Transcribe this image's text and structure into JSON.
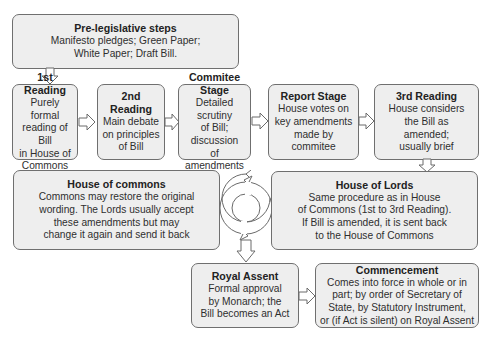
{
  "diagram": {
    "type": "flowchart",
    "colors": {
      "box_fill": "#eeeeee",
      "box_border": "#6f6f6f",
      "text": "#2a2a2a"
    },
    "nodes": [
      {
        "id": "pre",
        "title": "Pre-legislative steps",
        "body": "Manifesto pledges; Green Paper;\nWhite Paper; Draft Bill."
      },
      {
        "id": "r1",
        "title": "1st Reading",
        "body": "Purely formal\nreading of Bill\nin House of\nCommons"
      },
      {
        "id": "r2",
        "title": "2nd Reading",
        "body": "Main debate\non principles\nof Bill"
      },
      {
        "id": "committee",
        "title": "Commitee Stage",
        "body": "Detailed scrutiny\nof Bill; discussion\nof amendments"
      },
      {
        "id": "report",
        "title": "Report Stage",
        "body": "House votes on\nkey amendments\nmade by commitee"
      },
      {
        "id": "r3",
        "title": "3rd Reading",
        "body": "House considers\nthe Bill as\namended;\nusually brief"
      },
      {
        "id": "commons",
        "title": "House of commons",
        "body": "Commons may restore the original\nwording. The Lords usually accept\nthese amendments but may\nchange it again and send it back"
      },
      {
        "id": "lords",
        "title": "House of Lords",
        "body": "Same procedure as in House\nof Commons (1st to 3rd Reading).\nIf Bill is amended, it is sent back\nto the House of Commons"
      },
      {
        "id": "assent",
        "title": "Royal Assent",
        "body": "Formal approval\nby Monarch; the\nBill becomes an Act"
      },
      {
        "id": "commencement",
        "title": "Commencement",
        "body": "Comes into force in whole or in\npart; by order of Secretary of\nState, by Statutory Instrument,\nor (if Act is silent) on Royal Assent"
      }
    ],
    "edges": [
      {
        "from": "pre",
        "to": "r1",
        "direction": "down"
      },
      {
        "from": "r1",
        "to": "r2",
        "direction": "right"
      },
      {
        "from": "r2",
        "to": "committee",
        "direction": "right"
      },
      {
        "from": "committee",
        "to": "report",
        "direction": "right"
      },
      {
        "from": "report",
        "to": "r3",
        "direction": "right"
      },
      {
        "from": "r3",
        "to": "lords",
        "direction": "down"
      },
      {
        "from": "commons",
        "to": "lords",
        "direction": "cycle"
      },
      {
        "from": "cycle",
        "to": "assent",
        "direction": "down"
      },
      {
        "from": "assent",
        "to": "commencement",
        "direction": "right"
      }
    ],
    "icons": {
      "cycle": "cycle-arrows-icon",
      "flow_arrow": "hollow-block-arrow-icon"
    }
  }
}
